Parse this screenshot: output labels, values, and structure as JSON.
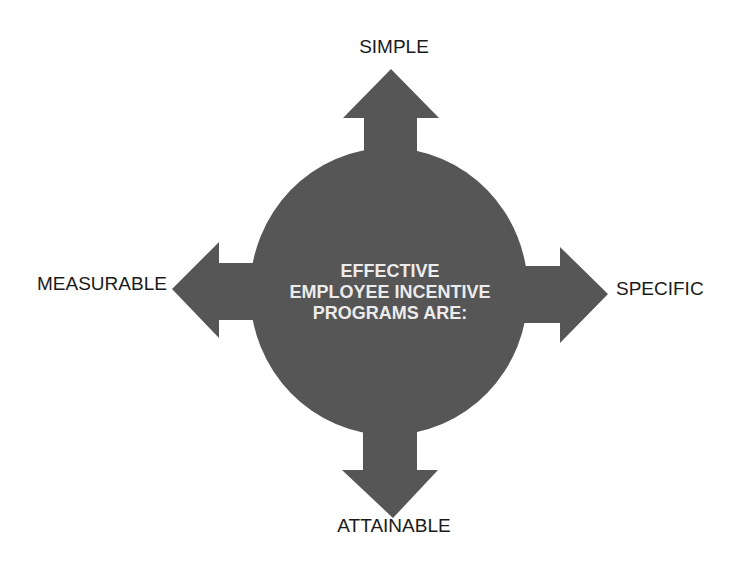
{
  "diagram": {
    "center": {
      "lines": [
        "EFFECTIVE",
        "EMPLOYEE INCENTIVE",
        "PROGRAMS ARE:"
      ]
    },
    "arrows": {
      "top": {
        "label": "SIMPLE"
      },
      "left": {
        "label": "MEASURABLE"
      },
      "right": {
        "label": "SPECIFIC"
      },
      "bottom": {
        "label": "ATTAINABLE"
      }
    },
    "colors": {
      "shape_fill": "#565656",
      "center_text": "#ececec",
      "label_text": "#1a1a1a",
      "background": "#ffffff"
    }
  }
}
